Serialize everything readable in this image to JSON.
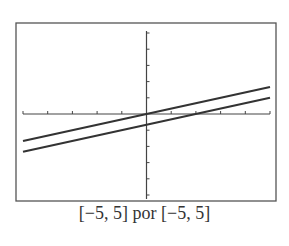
{
  "caption": "[−5, 5] por [−5, 5]",
  "chart_data": {
    "type": "line",
    "title": "",
    "xlabel": "",
    "ylabel": "",
    "xlim": [
      -5,
      5
    ],
    "ylim": [
      -5,
      5
    ],
    "xtick_step": 1,
    "ytick_step": 1,
    "grid": false,
    "series": [
      {
        "name": "line-1",
        "equation": "y = x/3",
        "x": [
          -5,
          5
        ],
        "y": [
          -1.667,
          1.667
        ]
      },
      {
        "name": "line-2",
        "equation": "y = x/3 - 2/3",
        "x": [
          -5,
          5
        ],
        "y": [
          -2.333,
          1.0
        ]
      }
    ]
  },
  "colors": {
    "frame": "#555555",
    "axes": "#444444",
    "lines": "#333333"
  }
}
